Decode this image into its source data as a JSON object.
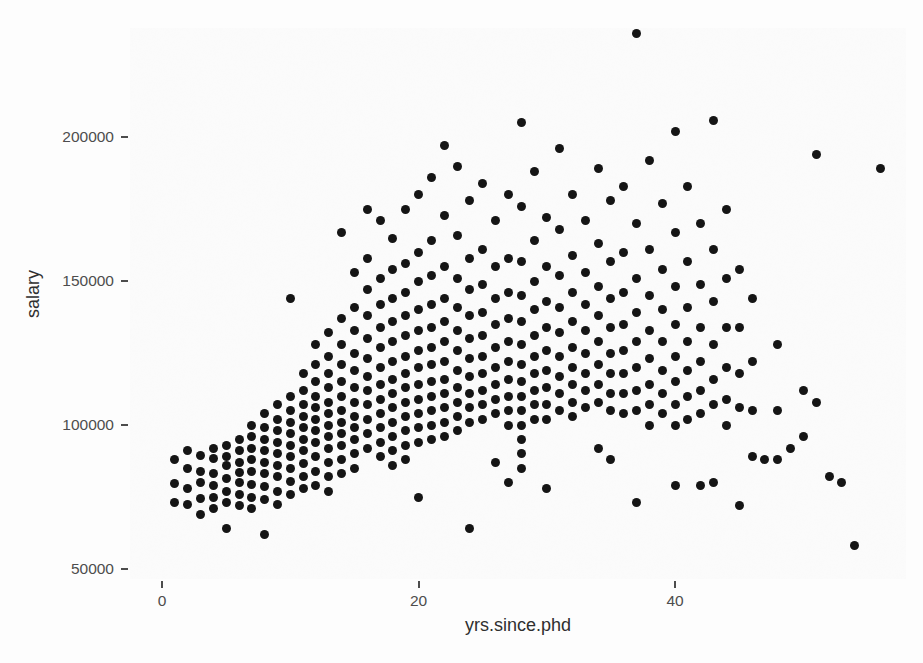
{
  "figure": {
    "kind": "scatter-plot",
    "background_color": "#fbfbfb",
    "point_color": "#151515",
    "axis_text_color": "#4d4d4d",
    "axis_title_color": "#2f2f2f"
  },
  "axes": {
    "y_title": "salary",
    "x_title": "yrs.since.phd",
    "y_ticks": [
      "50000",
      "100000",
      "150000",
      "200000"
    ],
    "x_ticks": [
      "0",
      "20",
      "40"
    ]
  },
  "chart_data": {
    "type": "scatter",
    "title": "",
    "xlabel": "yrs.since.phd",
    "ylabel": "salary",
    "xlim": [
      -2.5,
      58.0
    ],
    "ylim": [
      46500,
      238000
    ],
    "xticks": [
      0,
      20,
      40
    ],
    "yticks": [
      50000,
      100000,
      150000,
      200000
    ],
    "grid": false,
    "legend": "none",
    "marker": "filled-circle",
    "marker_color": "#151515",
    "marker_size_px": 9,
    "n_points": 397,
    "points": [
      [
        1,
        88000
      ],
      [
        1,
        79800
      ],
      [
        1,
        73000
      ],
      [
        2,
        91000
      ],
      [
        2,
        85000
      ],
      [
        2,
        78000
      ],
      [
        2,
        72500
      ],
      [
        3,
        89500
      ],
      [
        3,
        84000
      ],
      [
        3,
        80000
      ],
      [
        3,
        74500
      ],
      [
        3,
        69000
      ],
      [
        4,
        92000
      ],
      [
        4,
        88500
      ],
      [
        4,
        83000
      ],
      [
        4,
        79000
      ],
      [
        4,
        75000
      ],
      [
        4,
        71000
      ],
      [
        5,
        93000
      ],
      [
        5,
        89000
      ],
      [
        5,
        86000
      ],
      [
        5,
        81500
      ],
      [
        5,
        77000
      ],
      [
        5,
        73000
      ],
      [
        5,
        64000
      ],
      [
        6,
        95000
      ],
      [
        6,
        91000
      ],
      [
        6,
        87000
      ],
      [
        6,
        83500
      ],
      [
        6,
        80000
      ],
      [
        6,
        76000
      ],
      [
        6,
        72000
      ],
      [
        7,
        100000
      ],
      [
        7,
        96000
      ],
      [
        7,
        92000
      ],
      [
        7,
        88000
      ],
      [
        7,
        84000
      ],
      [
        7,
        79500
      ],
      [
        7,
        75000
      ],
      [
        7,
        71000
      ],
      [
        8,
        104000
      ],
      [
        8,
        99000
      ],
      [
        8,
        95000
      ],
      [
        8,
        91000
      ],
      [
        8,
        87000
      ],
      [
        8,
        83000
      ],
      [
        8,
        78500
      ],
      [
        8,
        74000
      ],
      [
        8,
        62000
      ],
      [
        9,
        107000
      ],
      [
        9,
        102000
      ],
      [
        9,
        98000
      ],
      [
        9,
        94000
      ],
      [
        9,
        90000
      ],
      [
        9,
        86000
      ],
      [
        9,
        82000
      ],
      [
        9,
        77000
      ],
      [
        9,
        72500
      ],
      [
        10,
        144000
      ],
      [
        10,
        110000
      ],
      [
        10,
        105000
      ],
      [
        10,
        101000
      ],
      [
        10,
        97000
      ],
      [
        10,
        93000
      ],
      [
        10,
        89000
      ],
      [
        10,
        85000
      ],
      [
        10,
        80500
      ],
      [
        10,
        76000
      ],
      [
        11,
        118000
      ],
      [
        11,
        112000
      ],
      [
        11,
        107000
      ],
      [
        11,
        103000
      ],
      [
        11,
        99000
      ],
      [
        11,
        95000
      ],
      [
        11,
        91000
      ],
      [
        11,
        86500
      ],
      [
        11,
        82000
      ],
      [
        11,
        78000
      ],
      [
        12,
        128000
      ],
      [
        12,
        121000
      ],
      [
        12,
        115000
      ],
      [
        12,
        110000
      ],
      [
        12,
        106000
      ],
      [
        12,
        102000
      ],
      [
        12,
        98000
      ],
      [
        12,
        94000
      ],
      [
        12,
        89000
      ],
      [
        12,
        84000
      ],
      [
        12,
        79000
      ],
      [
        13,
        132000
      ],
      [
        13,
        124000
      ],
      [
        13,
        118000
      ],
      [
        13,
        113000
      ],
      [
        13,
        108000
      ],
      [
        13,
        104000
      ],
      [
        13,
        100000
      ],
      [
        13,
        96000
      ],
      [
        13,
        92000
      ],
      [
        13,
        87000
      ],
      [
        13,
        82000
      ],
      [
        13,
        77000
      ],
      [
        14,
        167000
      ],
      [
        14,
        137000
      ],
      [
        14,
        128000
      ],
      [
        14,
        121000
      ],
      [
        14,
        115000
      ],
      [
        14,
        110000
      ],
      [
        14,
        105000
      ],
      [
        14,
        101000
      ],
      [
        14,
        97000
      ],
      [
        14,
        93000
      ],
      [
        14,
        88000
      ],
      [
        14,
        83000
      ],
      [
        15,
        153000
      ],
      [
        15,
        141000
      ],
      [
        15,
        133000
      ],
      [
        15,
        125000
      ],
      [
        15,
        119000
      ],
      [
        15,
        113000
      ],
      [
        15,
        108000
      ],
      [
        15,
        103000
      ],
      [
        15,
        99000
      ],
      [
        15,
        95000
      ],
      [
        15,
        90000
      ],
      [
        15,
        85000
      ],
      [
        16,
        175000
      ],
      [
        16,
        158000
      ],
      [
        16,
        147000
      ],
      [
        16,
        138000
      ],
      [
        16,
        130000
      ],
      [
        16,
        123000
      ],
      [
        16,
        117000
      ],
      [
        16,
        112000
      ],
      [
        16,
        107000
      ],
      [
        16,
        102000
      ],
      [
        16,
        97000
      ],
      [
        16,
        92000
      ],
      [
        17,
        171000
      ],
      [
        17,
        151000
      ],
      [
        17,
        142000
      ],
      [
        17,
        134000
      ],
      [
        17,
        127000
      ],
      [
        17,
        120000
      ],
      [
        17,
        114000
      ],
      [
        17,
        109000
      ],
      [
        17,
        104000
      ],
      [
        17,
        99000
      ],
      [
        17,
        94000
      ],
      [
        17,
        89000
      ],
      [
        18,
        165000
      ],
      [
        18,
        154000
      ],
      [
        18,
        144000
      ],
      [
        18,
        136000
      ],
      [
        18,
        129000
      ],
      [
        18,
        122000
      ],
      [
        18,
        116000
      ],
      [
        18,
        111000
      ],
      [
        18,
        106000
      ],
      [
        18,
        101000
      ],
      [
        18,
        96000
      ],
      [
        18,
        91000
      ],
      [
        18,
        86000
      ],
      [
        19,
        175000
      ],
      [
        19,
        156000
      ],
      [
        19,
        146000
      ],
      [
        19,
        138000
      ],
      [
        19,
        131000
      ],
      [
        19,
        124000
      ],
      [
        19,
        118000
      ],
      [
        19,
        113000
      ],
      [
        19,
        108000
      ],
      [
        19,
        103000
      ],
      [
        19,
        98000
      ],
      [
        19,
        93000
      ],
      [
        19,
        88000
      ],
      [
        20,
        180000
      ],
      [
        20,
        160000
      ],
      [
        20,
        150000
      ],
      [
        20,
        140000
      ],
      [
        20,
        133000
      ],
      [
        20,
        126000
      ],
      [
        20,
        120000
      ],
      [
        20,
        114000
      ],
      [
        20,
        109000
      ],
      [
        20,
        104000
      ],
      [
        20,
        99000
      ],
      [
        20,
        94000
      ],
      [
        20,
        75000
      ],
      [
        21,
        186000
      ],
      [
        21,
        164000
      ],
      [
        21,
        152000
      ],
      [
        21,
        142000
      ],
      [
        21,
        134000
      ],
      [
        21,
        127000
      ],
      [
        21,
        121000
      ],
      [
        21,
        115000
      ],
      [
        21,
        110000
      ],
      [
        21,
        105000
      ],
      [
        21,
        100000
      ],
      [
        21,
        95000
      ],
      [
        22,
        197000
      ],
      [
        22,
        173000
      ],
      [
        22,
        155000
      ],
      [
        22,
        144000
      ],
      [
        22,
        136000
      ],
      [
        22,
        129000
      ],
      [
        22,
        122000
      ],
      [
        22,
        116000
      ],
      [
        22,
        111000
      ],
      [
        22,
        106000
      ],
      [
        22,
        101000
      ],
      [
        22,
        96000
      ],
      [
        23,
        190000
      ],
      [
        23,
        166000
      ],
      [
        23,
        151000
      ],
      [
        23,
        141000
      ],
      [
        23,
        133000
      ],
      [
        23,
        126000
      ],
      [
        23,
        119000
      ],
      [
        23,
        113000
      ],
      [
        23,
        108000
      ],
      [
        23,
        103000
      ],
      [
        23,
        98000
      ],
      [
        24,
        178000
      ],
      [
        24,
        158000
      ],
      [
        24,
        147000
      ],
      [
        24,
        138000
      ],
      [
        24,
        130000
      ],
      [
        24,
        123000
      ],
      [
        24,
        117000
      ],
      [
        24,
        111000
      ],
      [
        24,
        106000
      ],
      [
        24,
        101000
      ],
      [
        24,
        64000
      ],
      [
        25,
        184000
      ],
      [
        25,
        161000
      ],
      [
        25,
        149000
      ],
      [
        25,
        139000
      ],
      [
        25,
        131000
      ],
      [
        25,
        124000
      ],
      [
        25,
        118000
      ],
      [
        25,
        112000
      ],
      [
        25,
        107000
      ],
      [
        25,
        102000
      ],
      [
        26,
        171000
      ],
      [
        26,
        155000
      ],
      [
        26,
        144000
      ],
      [
        26,
        135000
      ],
      [
        26,
        127000
      ],
      [
        26,
        120000
      ],
      [
        26,
        114000
      ],
      [
        26,
        109000
      ],
      [
        26,
        104000
      ],
      [
        26,
        87000
      ],
      [
        27,
        180000
      ],
      [
        27,
        158000
      ],
      [
        27,
        146000
      ],
      [
        27,
        137000
      ],
      [
        27,
        129000
      ],
      [
        27,
        122000
      ],
      [
        27,
        116000
      ],
      [
        27,
        110000
      ],
      [
        27,
        105000
      ],
      [
        27,
        100000
      ],
      [
        27,
        80000
      ],
      [
        28,
        205000
      ],
      [
        28,
        176000
      ],
      [
        28,
        157000
      ],
      [
        28,
        145000
      ],
      [
        28,
        136000
      ],
      [
        28,
        128000
      ],
      [
        28,
        121000
      ],
      [
        28,
        115000
      ],
      [
        28,
        110000
      ],
      [
        28,
        105000
      ],
      [
        28,
        100000
      ],
      [
        28,
        95000
      ],
      [
        28,
        90000
      ],
      [
        28,
        85000
      ],
      [
        29,
        188000
      ],
      [
        29,
        164000
      ],
      [
        29,
        150000
      ],
      [
        29,
        140000
      ],
      [
        29,
        131000
      ],
      [
        29,
        124000
      ],
      [
        29,
        118000
      ],
      [
        29,
        112000
      ],
      [
        29,
        107000
      ],
      [
        29,
        102000
      ],
      [
        30,
        172000
      ],
      [
        30,
        155000
      ],
      [
        30,
        143000
      ],
      [
        30,
        134000
      ],
      [
        30,
        126000
      ],
      [
        30,
        119000
      ],
      [
        30,
        113000
      ],
      [
        30,
        107000
      ],
      [
        30,
        102000
      ],
      [
        30,
        78000
      ],
      [
        31,
        196000
      ],
      [
        31,
        168000
      ],
      [
        31,
        152000
      ],
      [
        31,
        141000
      ],
      [
        31,
        132000
      ],
      [
        31,
        124000
      ],
      [
        31,
        117000
      ],
      [
        31,
        111000
      ],
      [
        31,
        105000
      ],
      [
        32,
        180000
      ],
      [
        32,
        159000
      ],
      [
        32,
        146000
      ],
      [
        32,
        136000
      ],
      [
        32,
        127000
      ],
      [
        32,
        120000
      ],
      [
        32,
        114000
      ],
      [
        32,
        108000
      ],
      [
        32,
        103000
      ],
      [
        33,
        171000
      ],
      [
        33,
        153000
      ],
      [
        33,
        142000
      ],
      [
        33,
        133000
      ],
      [
        33,
        125000
      ],
      [
        33,
        118000
      ],
      [
        33,
        112000
      ],
      [
        33,
        106000
      ],
      [
        34,
        189000
      ],
      [
        34,
        163000
      ],
      [
        34,
        148000
      ],
      [
        34,
        138000
      ],
      [
        34,
        129000
      ],
      [
        34,
        121000
      ],
      [
        34,
        114000
      ],
      [
        34,
        108000
      ],
      [
        34,
        92000
      ],
      [
        35,
        178000
      ],
      [
        35,
        157000
      ],
      [
        35,
        144000
      ],
      [
        35,
        134000
      ],
      [
        35,
        125000
      ],
      [
        35,
        118000
      ],
      [
        35,
        111000
      ],
      [
        35,
        105000
      ],
      [
        35,
        88000
      ],
      [
        36,
        183000
      ],
      [
        36,
        160000
      ],
      [
        36,
        146000
      ],
      [
        36,
        135000
      ],
      [
        36,
        126000
      ],
      [
        36,
        118000
      ],
      [
        36,
        111000
      ],
      [
        36,
        104000
      ],
      [
        37,
        236000
      ],
      [
        37,
        170000
      ],
      [
        37,
        151000
      ],
      [
        37,
        139000
      ],
      [
        37,
        129000
      ],
      [
        37,
        120000
      ],
      [
        37,
        112000
      ],
      [
        37,
        105000
      ],
      [
        37,
        73000
      ],
      [
        38,
        192000
      ],
      [
        38,
        161000
      ],
      [
        38,
        145000
      ],
      [
        38,
        133000
      ],
      [
        38,
        123000
      ],
      [
        38,
        114000
      ],
      [
        38,
        107000
      ],
      [
        38,
        100000
      ],
      [
        39,
        177000
      ],
      [
        39,
        154000
      ],
      [
        39,
        140000
      ],
      [
        39,
        129000
      ],
      [
        39,
        119000
      ],
      [
        39,
        111000
      ],
      [
        39,
        104000
      ],
      [
        40,
        202000
      ],
      [
        40,
        167000
      ],
      [
        40,
        148000
      ],
      [
        40,
        135000
      ],
      [
        40,
        124000
      ],
      [
        40,
        115000
      ],
      [
        40,
        107000
      ],
      [
        40,
        100000
      ],
      [
        40,
        79000
      ],
      [
        41,
        183000
      ],
      [
        41,
        157000
      ],
      [
        41,
        141000
      ],
      [
        41,
        129000
      ],
      [
        41,
        119000
      ],
      [
        41,
        110000
      ],
      [
        41,
        102000
      ],
      [
        42,
        170000
      ],
      [
        42,
        149000
      ],
      [
        42,
        134000
      ],
      [
        42,
        122000
      ],
      [
        42,
        112000
      ],
      [
        42,
        104000
      ],
      [
        42,
        79000
      ],
      [
        43,
        206000
      ],
      [
        43,
        161000
      ],
      [
        43,
        143000
      ],
      [
        43,
        128000
      ],
      [
        43,
        116000
      ],
      [
        43,
        107000
      ],
      [
        43,
        80000
      ],
      [
        44,
        175000
      ],
      [
        44,
        151000
      ],
      [
        44,
        134000
      ],
      [
        44,
        120000
      ],
      [
        44,
        109000
      ],
      [
        44,
        100000
      ],
      [
        45,
        154000
      ],
      [
        45,
        134000
      ],
      [
        45,
        118000
      ],
      [
        45,
        106000
      ],
      [
        45,
        72000
      ],
      [
        46,
        144000
      ],
      [
        46,
        122000
      ],
      [
        46,
        105000
      ],
      [
        46,
        89000
      ],
      [
        47,
        88000
      ],
      [
        48,
        128000
      ],
      [
        48,
        105000
      ],
      [
        48,
        88000
      ],
      [
        49,
        92000
      ],
      [
        50,
        112000
      ],
      [
        50,
        96000
      ],
      [
        51,
        194000
      ],
      [
        51,
        108000
      ],
      [
        52,
        82000
      ],
      [
        53,
        80000
      ],
      [
        54,
        58000
      ],
      [
        56,
        189000
      ]
    ]
  }
}
